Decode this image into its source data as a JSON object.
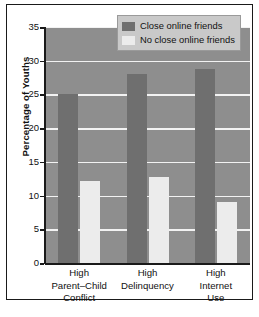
{
  "chart_data": {
    "type": "bar",
    "title": "",
    "xlabel": "",
    "ylabel": "Percentage of Youths",
    "ylim": [
      0,
      35
    ],
    "yticks": [
      0,
      5,
      10,
      15,
      20,
      25,
      30,
      35
    ],
    "ytick_labels": [
      "0",
      "5",
      "10",
      "15",
      "20",
      "25",
      "30",
      "35"
    ],
    "grid": true,
    "legend_position": "top-right",
    "categories": [
      "High Parent–Child Conflict",
      "High Delinquency",
      "High Internet Use"
    ],
    "category_lines": [
      [
        "High",
        "Parent–Child",
        "Conflict"
      ],
      [
        "High",
        "Delinquency"
      ],
      [
        "High",
        "Internet",
        "Use"
      ]
    ],
    "series": [
      {
        "name": "Close online friends",
        "color": "#6f6f6f",
        "values": [
          25.0,
          28.0,
          28.8
        ]
      },
      {
        "name": "No close online friends",
        "color": "#ececec",
        "values": [
          12.2,
          12.7,
          9.0
        ]
      }
    ],
    "plot_background": "#8e8e8e",
    "gridline_color": "#f2f2f2",
    "axis_color": "#1a1a1a",
    "frame_color": "#1a1a1a"
  }
}
